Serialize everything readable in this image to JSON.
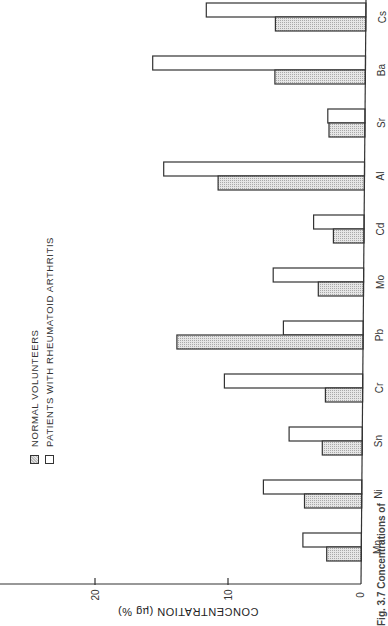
{
  "chart_data": {
    "type": "bar",
    "orientation": "rotated 90deg clockwise (value axis horizontal at bottom, bars extend left from baseline at right)",
    "title": "",
    "caption": "Fig. 3.7 Concentrations of",
    "xlabel": "",
    "ylabel": "CONCENTRATION (µg %)",
    "ylim": [
      0,
      27
    ],
    "yticks": [
      0,
      10,
      20
    ],
    "ytick_labels": [
      "0",
      "10",
      "20"
    ],
    "grid": false,
    "legend_position": "upper-left (rotated)",
    "categories": [
      "Mn",
      "Ni",
      "Sn",
      "Cr",
      "Pb",
      "Mo",
      "Cd",
      "Al",
      "Sr",
      "Ba",
      "Cs"
    ],
    "series": [
      {
        "name": "NORMAL VOLUNTEERS",
        "pattern": "stippled",
        "values": [
          2.6,
          4.3,
          3.0,
          2.8,
          14.0,
          3.4,
          2.3,
          11.0,
          2.7,
          6.8,
          6.8
        ]
      },
      {
        "name": "PATIENTS WITH RHEUMATOID ARTHRITIS",
        "pattern": "open",
        "values": [
          4.4,
          7.4,
          5.5,
          10.4,
          6.0,
          6.8,
          3.8,
          15.1,
          2.8,
          16.0,
          12.0
        ]
      }
    ]
  },
  "legend": {
    "normal_label": "NORMAL VOLUNTEERS",
    "patient_label": "PATIENTS WITH RHEUMATOID ARTHRITIS"
  },
  "axis": {
    "title": "CONCENTRATION (µg %)",
    "ticks": [
      "0",
      "10",
      "20"
    ]
  },
  "caption": "Fig. 3.7 Concentrations of",
  "colors": {
    "ink": "#333333",
    "stipple_dark": "#bdbdbd",
    "stipple_light": "#e6e6e6",
    "background": "#ffffff"
  }
}
